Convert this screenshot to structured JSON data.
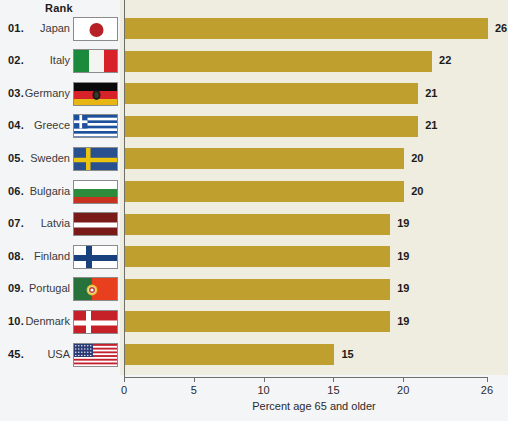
{
  "header": {
    "rank_label": "Rank"
  },
  "chart_data": {
    "type": "bar",
    "orientation": "horizontal",
    "title": "",
    "xlabel": "Percent age 65 and older",
    "ylabel": "",
    "xlim": [
      0,
      26
    ],
    "xticks": [
      0,
      5,
      10,
      15,
      20,
      26
    ],
    "xticklabels": [
      "0",
      "5",
      "10",
      "15",
      "20",
      "26"
    ],
    "grid": false,
    "legend": "none",
    "bar_color": "#bfa02e",
    "plot_background": "#efece0",
    "page_background": "#f4f5f7",
    "categories": [
      "Japan",
      "Italy",
      "Germany",
      "Greece",
      "Sweden",
      "Bulgaria",
      "Latvia",
      "Finland",
      "Portugal",
      "Denmark",
      "USA"
    ],
    "values": [
      26,
      22,
      21,
      21,
      20,
      20,
      19,
      19,
      19,
      19,
      15
    ],
    "ranks": [
      "01.",
      "02.",
      "03.",
      "04.",
      "05.",
      "06.",
      "07.",
      "08.",
      "09.",
      "10.",
      "45."
    ],
    "value_labels": [
      "26",
      "22",
      "21",
      "21",
      "20",
      "20",
      "19",
      "19",
      "19",
      "19",
      "15"
    ]
  },
  "rows": [
    {
      "rank": "01.",
      "country": "Japan",
      "value": 26,
      "value_label": "26",
      "flag": "flag-japan"
    },
    {
      "rank": "02.",
      "country": "Italy",
      "value": 22,
      "value_label": "22",
      "flag": "flag-italy"
    },
    {
      "rank": "03.",
      "country": "Germany",
      "value": 21,
      "value_label": "21",
      "flag": "flag-germany"
    },
    {
      "rank": "04.",
      "country": "Greece",
      "value": 21,
      "value_label": "21",
      "flag": "flag-greece"
    },
    {
      "rank": "05.",
      "country": "Sweden",
      "value": 20,
      "value_label": "20",
      "flag": "flag-sweden"
    },
    {
      "rank": "06.",
      "country": "Bulgaria",
      "value": 20,
      "value_label": "20",
      "flag": "flag-bulgaria"
    },
    {
      "rank": "07.",
      "country": "Latvia",
      "value": 19,
      "value_label": "19",
      "flag": "flag-latvia"
    },
    {
      "rank": "08.",
      "country": "Finland",
      "value": 19,
      "value_label": "19",
      "flag": "flag-finland"
    },
    {
      "rank": "09.",
      "country": "Portugal",
      "value": 19,
      "value_label": "19",
      "flag": "flag-portugal"
    },
    {
      "rank": "10.",
      "country": "Denmark",
      "value": 19,
      "value_label": "19",
      "flag": "flag-denmark"
    },
    {
      "rank": "45.",
      "country": "USA",
      "value": 15,
      "value_label": "15",
      "flag": "flag-usa"
    }
  ]
}
